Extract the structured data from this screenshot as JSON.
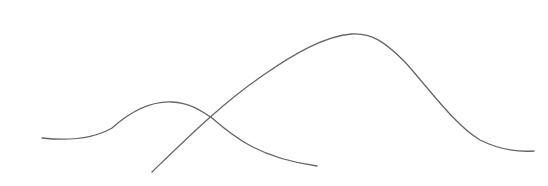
{
  "canvas": {
    "width": 548,
    "height": 186,
    "background": "#ffffff"
  },
  "curves": [
    {
      "name": "small-bump-curve",
      "color": "#666666",
      "stroke_width": 1.3,
      "path": "M42,138 C70,141 95,138 112,128 C130,112 150,101 172,102 C190,103 200,110 212,118 C235,138 260,158 317,166"
    },
    {
      "name": "large-hump-curve",
      "color": "#666666",
      "stroke_width": 1.3,
      "path": "M152,172 C185,140 220,105 262,76 C295,53 325,36 352,34 C372,33 385,42 405,62 C430,90 455,125 480,140 C500,150 520,152 534,151"
    }
  ]
}
